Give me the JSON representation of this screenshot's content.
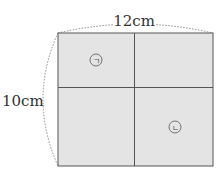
{
  "diagram": {
    "width_label": "12cm",
    "height_label": "10cm",
    "regions": [
      {
        "id": "region-a",
        "label": "ㄱ"
      },
      {
        "id": "region-b",
        "label": "ㄴ"
      }
    ],
    "colors": {
      "fill": "#e4e4e4",
      "border": "#555555",
      "dotted": "#888888"
    }
  }
}
